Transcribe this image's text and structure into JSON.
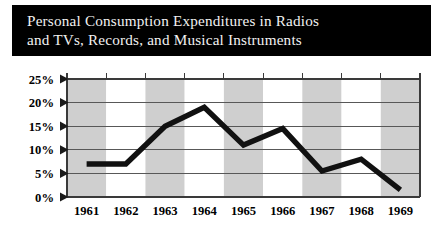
{
  "title": {
    "line1": "Personal Consumption Expenditures in Radios",
    "line2": "and TVs, Records, and Musical Instruments",
    "full": "Personal Consumption Expenditures in Radios\nand TVs, Records, and Musical Instruments",
    "text_color": "#f2f2f2",
    "background_color": "#000000"
  },
  "chart_data": {
    "type": "line",
    "title": "Personal Consumption Expenditures in Radios and TVs, Records, and Musical Instruments",
    "xlabel": "",
    "ylabel": "",
    "categories": [
      "1961",
      "1962",
      "1963",
      "1964",
      "1965",
      "1966",
      "1967",
      "1968",
      "1969"
    ],
    "values": [
      7,
      7,
      15,
      19,
      11,
      14.5,
      5.5,
      8,
      1.5
    ],
    "series": [
      {
        "name": "Personal Consumption Expenditures",
        "values": [
          7,
          7,
          15,
          19,
          11,
          14.5,
          5.5,
          8,
          1.5
        ],
        "color": "#111111",
        "line_width": 5.4
      }
    ],
    "ylim": [
      0,
      25
    ],
    "ytick_values": [
      0,
      5,
      10,
      15,
      20,
      25
    ],
    "ytick_labels": [
      "0%",
      "5%",
      "10%",
      "15%",
      "20%",
      "25%"
    ],
    "xtick_labels": [
      "1961",
      "1962",
      "1963",
      "1964",
      "1965",
      "1966",
      "1967",
      "1968",
      "1969"
    ],
    "grid": true,
    "grid_orientation": "horizontal",
    "legend": false,
    "legend_position": "none",
    "band_shading": {
      "enabled": true,
      "shaded_categories": [
        "1961",
        "1963",
        "1965",
        "1967",
        "1969"
      ],
      "shade_color": "#cfcfcf",
      "light_color": "#ffffff"
    },
    "annotations": []
  },
  "axis": {
    "y_labels": [
      "25%",
      "20%",
      "15%",
      "10%",
      "5%",
      "0%"
    ],
    "x_labels": [
      "1961",
      "1962",
      "1963",
      "1964",
      "1965",
      "1966",
      "1967",
      "1968",
      "1969"
    ]
  }
}
